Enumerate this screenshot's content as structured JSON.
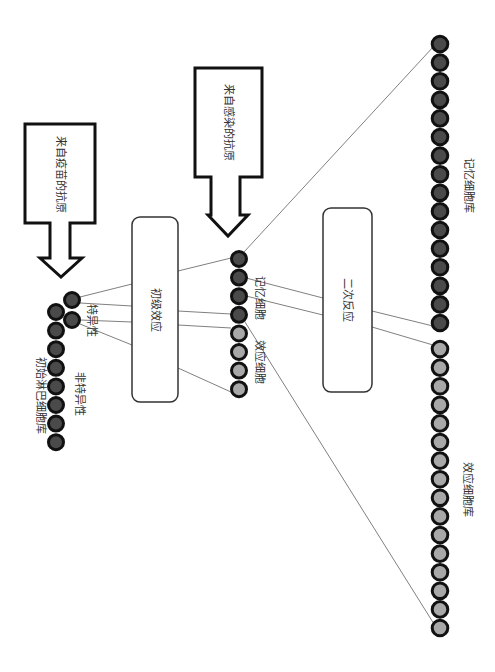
{
  "diagram": {
    "arrows": [
      {
        "id": "vaccine-antigen",
        "label": "来自疫苗的抗原"
      },
      {
        "id": "infection-antigen",
        "label": "来自感染的抗原"
      }
    ],
    "boxes": {
      "primary": "初级效应",
      "secondary": "二次反应"
    },
    "labels": {
      "naive_pool": "初始淋巴细胞库",
      "nonspecific": "非特异性",
      "specific": "特异性",
      "memory_cells": "记忆细胞",
      "effector_cells": "效应细胞",
      "memory_pool": "记忆细胞库",
      "effector_pool": "效应细胞库"
    },
    "cell_counts": {
      "naive_pool": 8,
      "specific": 2,
      "middle_memory": 4,
      "middle_effector": 4,
      "memory_pool": 16,
      "effector_pool": 16
    },
    "colors": {
      "dark_cell": "#4a4a4a",
      "light_cell": "#a8a8a8",
      "outline": "#111111",
      "line": "#777777"
    }
  }
}
